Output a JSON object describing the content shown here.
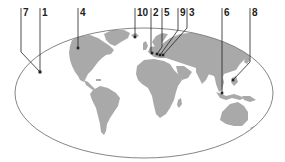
{
  "map": {
    "projection": "elliptical world map",
    "land_color": "#a9a9a9",
    "outline_color": "#777777",
    "leader_color": "#222222",
    "ellipse": {
      "cx": 144,
      "cy": 93,
      "rx": 129,
      "ry": 65
    }
  },
  "markers": [
    {
      "id": "7",
      "label": "7",
      "label_x": 21,
      "path": [
        [
          21,
          8
        ],
        [
          21,
          52
        ],
        [
          40,
          72
        ]
      ],
      "point": [
        40,
        72
      ],
      "region": "Pacific (west of North America)"
    },
    {
      "id": "1",
      "label": "1",
      "label_x": 40,
      "path": [
        [
          40,
          8
        ],
        [
          40,
          72
        ]
      ],
      "point": [
        40,
        72
      ],
      "region": "Pacific (west of North America)"
    },
    {
      "id": "4",
      "label": "4",
      "label_x": 78,
      "path": [
        [
          78,
          8
        ],
        [
          78,
          48
        ]
      ],
      "point": [
        78,
        48
      ],
      "region": "North America"
    },
    {
      "id": "10",
      "label": "10",
      "label_x": 135,
      "path": [
        [
          135,
          8
        ],
        [
          135,
          37
        ]
      ],
      "point": [
        135,
        37
      ],
      "region": "Iceland / North Atlantic"
    },
    {
      "id": "2",
      "label": "2",
      "label_x": 151,
      "path": [
        [
          151,
          8
        ],
        [
          151,
          52
        ],
        [
          152,
          53
        ]
      ],
      "point": [
        152,
        53
      ],
      "region": "Western Europe"
    },
    {
      "id": "5",
      "label": "5",
      "label_x": 162,
      "path": [
        [
          162,
          8
        ],
        [
          162,
          47
        ],
        [
          157,
          54
        ]
      ],
      "point": [
        157,
        54
      ],
      "region": "Western Europe"
    },
    {
      "id": "9",
      "label": "9",
      "label_x": 178,
      "path": [
        [
          178,
          8
        ],
        [
          178,
          30
        ],
        [
          160,
          55
        ]
      ],
      "point": [
        160,
        55
      ],
      "region": "Central Europe"
    },
    {
      "id": "3",
      "label": "3",
      "label_x": 187,
      "path": [
        [
          187,
          8
        ],
        [
          187,
          28
        ],
        [
          163,
          55
        ]
      ],
      "point": [
        163,
        55
      ],
      "region": "Central Europe"
    },
    {
      "id": "6",
      "label": "6",
      "label_x": 222,
      "path": [
        [
          222,
          8
        ],
        [
          222,
          93
        ]
      ],
      "point": [
        222,
        93
      ],
      "region": "Southeast Asia"
    },
    {
      "id": "8",
      "label": "8",
      "label_x": 250,
      "path": [
        [
          250,
          8
        ],
        [
          250,
          62
        ],
        [
          233,
          80
        ]
      ],
      "point": [
        233,
        80
      ],
      "region": "East Asia / Philippines"
    }
  ]
}
